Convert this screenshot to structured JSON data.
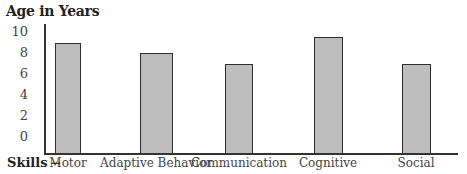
{
  "chart_data": {
    "type": "bar",
    "title": "",
    "ylabel": "Age in Years",
    "xlabel": "Skills →",
    "categories": [
      "Motor",
      "Adaptive Behavior",
      "Communication",
      "Cognitive",
      "Social"
    ],
    "values": [
      9,
      8,
      7,
      9.5,
      7
    ],
    "yticks": [
      "10",
      "8",
      "6",
      "4",
      "2",
      "0"
    ],
    "ylim": [
      0,
      10
    ],
    "grid": false,
    "legend": null,
    "bar_color": "#bdbdbd",
    "bar_edge_color": "#2e2e2e"
  },
  "labels": {
    "y_axis_title": "Age in Years",
    "x_axis_prefix": "Skills",
    "x_axis_arrow": "→"
  }
}
